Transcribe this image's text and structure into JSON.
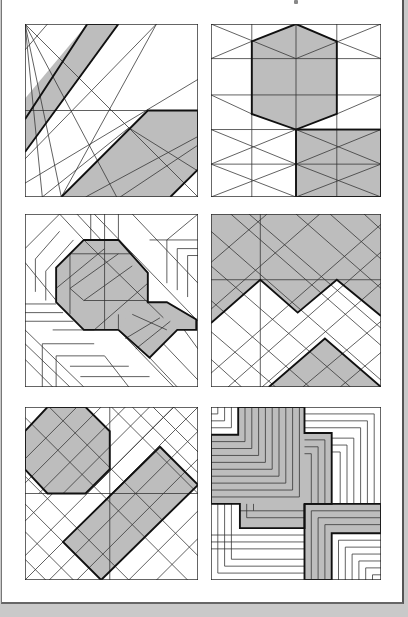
{
  "page": {
    "background_color": "#ffffff",
    "outer_color": "#c9c9c9",
    "shade_color": "#bdbdbd",
    "line_color": "#333333",
    "page_number": "",
    "layout": "3 rows x 2 columns of square line-drawing patchwork diagrams"
  },
  "panels": [
    {
      "id": "top-left",
      "description": "Square with radiating lines from top-left corner, shaded diagonal band upper-left and shaded trapezoid lower-right"
    },
    {
      "id": "top-right",
      "description": "Grid with crossing diagonals, shaded hexagon upper-center and shaded rectangle lower-right"
    },
    {
      "id": "middle-left",
      "description": "Chevron-striped square with shaded octagon and adjoining shaded hexagonal arm"
    },
    {
      "id": "middle-right",
      "description": "Diagonal lattice with shaded upper zigzag region and shaded lower triangle"
    },
    {
      "id": "bottom-left",
      "description": "Diagonal lattice with shaded octagon upper-left and shaded rotated rectangle"
    },
    {
      "id": "bottom-right",
      "description": "Concentric L-shaped stripe squares, shaded upper-left block and shaded lower-right block"
    }
  ]
}
